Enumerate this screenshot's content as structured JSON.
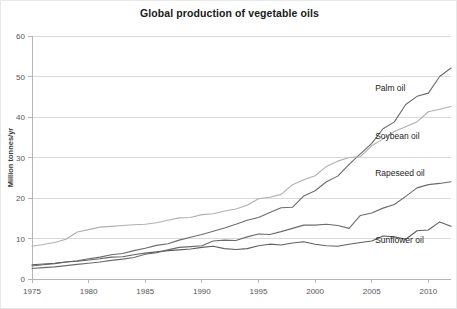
{
  "chart_data": {
    "type": "line",
    "title": "Global production of vegetable oils",
    "xlabel": "",
    "ylabel": "Million tonnes/yr",
    "xlim": [
      1975,
      2012
    ],
    "ylim": [
      0,
      60
    ],
    "yticks": [
      0,
      10,
      20,
      30,
      40,
      50,
      60
    ],
    "xticks": [
      1975,
      1980,
      1985,
      1990,
      1995,
      2000,
      2005,
      2010
    ],
    "xtick_labels": [
      "1975",
      "1980",
      "1985",
      "1990",
      "1995",
      "2000",
      "2005",
      "2010"
    ],
    "ytick_labels": [
      "0",
      "10",
      "20",
      "30",
      "40",
      "50",
      "60"
    ],
    "grid": "horizontal",
    "legend": "inline-labels",
    "x": [
      1975,
      1976,
      1977,
      1978,
      1979,
      1980,
      1981,
      1982,
      1983,
      1984,
      1985,
      1986,
      1987,
      1988,
      1989,
      1990,
      1991,
      1992,
      1993,
      1994,
      1995,
      1996,
      1997,
      1998,
      1999,
      2000,
      2001,
      2002,
      2003,
      2004,
      2005,
      2006,
      2007,
      2008,
      2009,
      2010,
      2011,
      2012
    ],
    "series": [
      {
        "name": "Palm oil",
        "color": "#6b6b6b",
        "label_x": 2005.3,
        "label_y": 46.5,
        "values": [
          3.2,
          3.5,
          3.8,
          4.2,
          4.5,
          5.0,
          5.4,
          6.0,
          6.3,
          7.0,
          7.6,
          8.3,
          8.7,
          9.6,
          10.3,
          11.0,
          11.8,
          12.6,
          13.5,
          14.5,
          15.2,
          16.4,
          17.6,
          17.7,
          20.5,
          21.8,
          24.0,
          25.4,
          28.3,
          30.9,
          33.5,
          37.1,
          38.8,
          43.1,
          45.1,
          45.9,
          50.0,
          52.1
        ]
      },
      {
        "name": "Soybean oil",
        "color": "#b0b0b0",
        "label_x": 2005.3,
        "label_y": 34.5,
        "values": [
          8.1,
          8.5,
          9.0,
          9.8,
          11.6,
          12.2,
          12.8,
          13.0,
          13.2,
          13.4,
          13.5,
          13.9,
          14.5,
          15.1,
          15.2,
          15.9,
          16.1,
          16.8,
          17.3,
          18.2,
          19.8,
          20.2,
          20.9,
          23.3,
          24.5,
          25.5,
          27.8,
          29.1,
          30.0,
          30.2,
          32.9,
          34.6,
          36.4,
          37.6,
          38.8,
          41.3,
          41.9,
          42.6
        ]
      },
      {
        "name": "Rapeseed oil",
        "color": "#6b6b6b",
        "label_x": 2005.3,
        "label_y": 25.5,
        "values": [
          2.6,
          2.8,
          3.0,
          3.3,
          3.6,
          3.9,
          4.2,
          4.6,
          4.9,
          5.3,
          6.1,
          6.5,
          7.2,
          7.8,
          8.0,
          8.2,
          9.4,
          9.6,
          9.5,
          10.4,
          11.1,
          11.0,
          11.7,
          12.5,
          13.3,
          13.3,
          13.5,
          13.2,
          12.5,
          15.7,
          16.3,
          17.5,
          18.4,
          20.4,
          22.5,
          23.3,
          23.6,
          24.0
        ]
      },
      {
        "name": "Sunflower oil",
        "color": "#5f5f5f",
        "label_x": 2005.3,
        "label_y": 9.0,
        "values": [
          3.5,
          3.7,
          3.9,
          4.2,
          4.4,
          4.7,
          5.0,
          5.4,
          5.5,
          6.0,
          6.4,
          6.7,
          7.0,
          7.2,
          7.4,
          7.8,
          8.1,
          7.5,
          7.3,
          7.5,
          8.2,
          8.6,
          8.4,
          8.9,
          9.2,
          8.6,
          8.2,
          8.1,
          8.6,
          9.0,
          9.4,
          10.6,
          10.4,
          9.8,
          11.9,
          12.1,
          14.1,
          13.0
        ]
      }
    ]
  }
}
